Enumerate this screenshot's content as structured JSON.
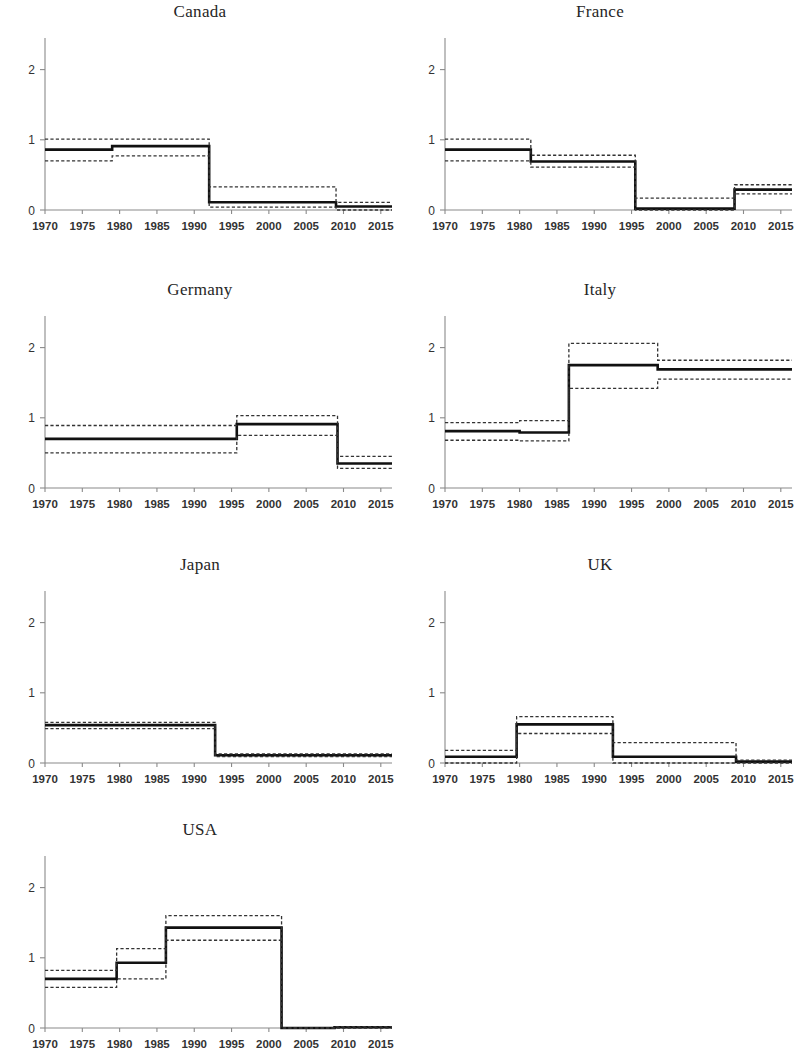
{
  "figure": {
    "panel_count": 7,
    "layout": "4 rows x 2 columns (last row single panel)"
  },
  "axes": {
    "x_ticks": [
      "1970",
      "1975",
      "1980",
      "1985",
      "1990",
      "1995",
      "2000",
      "2005",
      "2010",
      "2015"
    ],
    "x_tick_values": [
      1970,
      1975,
      1980,
      1985,
      1990,
      1995,
      2000,
      2005,
      2010,
      2015
    ],
    "y_ticks": [
      "0",
      "1",
      "2"
    ],
    "y_tick_values": [
      0,
      1,
      2
    ],
    "xlim": [
      1970,
      2016.5
    ],
    "ylim": [
      0,
      2.45
    ]
  },
  "chart_data": [
    {
      "type": "line",
      "title": "Canada",
      "xlabel": "",
      "ylabel": "",
      "xlim": [
        1970,
        2016.5
      ],
      "ylim": [
        0,
        2.45
      ],
      "grid": false,
      "legend": "none",
      "x_ticks": [
        1970,
        1975,
        1980,
        1985,
        1990,
        1995,
        2000,
        2005,
        2010,
        2015
      ],
      "y_ticks": [
        0,
        1,
        2
      ],
      "series": [
        {
          "name": "estimate",
          "style": "solid",
          "steps": [
            {
              "from": 1970,
              "to": 1979,
              "value": 0.86
            },
            {
              "from": 1979,
              "to": 1992,
              "value": 0.91
            },
            {
              "from": 1992,
              "to": 2009,
              "value": 0.11
            },
            {
              "from": 2009,
              "to": 2016.5,
              "value": 0.05
            }
          ]
        },
        {
          "name": "upper-confidence-band",
          "style": "dashed",
          "steps": [
            {
              "from": 1970,
              "to": 1979,
              "value": 1.01
            },
            {
              "from": 1979,
              "to": 1992,
              "value": 1.01
            },
            {
              "from": 1992,
              "to": 2009,
              "value": 0.33
            },
            {
              "from": 2009,
              "to": 2016.5,
              "value": 0.11
            }
          ]
        },
        {
          "name": "lower-confidence-band",
          "style": "dashed",
          "steps": [
            {
              "from": 1970,
              "to": 1979,
              "value": 0.7
            },
            {
              "from": 1979,
              "to": 1992,
              "value": 0.77
            },
            {
              "from": 1992,
              "to": 2009,
              "value": 0.04
            },
            {
              "from": 2009,
              "to": 2016.5,
              "value": 0.0
            }
          ]
        }
      ]
    },
    {
      "type": "line",
      "title": "France",
      "xlabel": "",
      "ylabel": "",
      "xlim": [
        1970,
        2016.5
      ],
      "ylim": [
        0,
        2.45
      ],
      "grid": false,
      "legend": "none",
      "x_ticks": [
        1970,
        1975,
        1980,
        1985,
        1990,
        1995,
        2000,
        2005,
        2010,
        2015
      ],
      "y_ticks": [
        0,
        1,
        2
      ],
      "series": [
        {
          "name": "estimate",
          "style": "solid",
          "steps": [
            {
              "from": 1970,
              "to": 1981.5,
              "value": 0.86
            },
            {
              "from": 1981.5,
              "to": 1995.5,
              "value": 0.69
            },
            {
              "from": 1995.5,
              "to": 2008.8,
              "value": 0.02
            },
            {
              "from": 2008.8,
              "to": 2016.5,
              "value": 0.29
            }
          ]
        },
        {
          "name": "upper-confidence-band",
          "style": "dashed",
          "steps": [
            {
              "from": 1970,
              "to": 1981.5,
              "value": 1.01
            },
            {
              "from": 1981.5,
              "to": 1995.5,
              "value": 0.78
            },
            {
              "from": 1995.5,
              "to": 2008.8,
              "value": 0.17
            },
            {
              "from": 2008.8,
              "to": 2016.5,
              "value": 0.36
            }
          ]
        },
        {
          "name": "lower-confidence-band",
          "style": "dashed",
          "steps": [
            {
              "from": 1970,
              "to": 1981.5,
              "value": 0.7
            },
            {
              "from": 1981.5,
              "to": 1995.5,
              "value": 0.61
            },
            {
              "from": 1995.5,
              "to": 2008.8,
              "value": 0.0
            },
            {
              "from": 2008.8,
              "to": 2016.5,
              "value": 0.23
            }
          ]
        }
      ]
    },
    {
      "type": "line",
      "title": "Germany",
      "xlabel": "",
      "ylabel": "",
      "xlim": [
        1970,
        2016.5
      ],
      "ylim": [
        0,
        2.45
      ],
      "grid": false,
      "legend": "none",
      "x_ticks": [
        1970,
        1975,
        1980,
        1985,
        1990,
        1995,
        2000,
        2005,
        2010,
        2015
      ],
      "y_ticks": [
        0,
        1,
        2
      ],
      "series": [
        {
          "name": "estimate",
          "style": "solid",
          "steps": [
            {
              "from": 1970,
              "to": 1995.7,
              "value": 0.7
            },
            {
              "from": 1995.7,
              "to": 2009.2,
              "value": 0.91
            },
            {
              "from": 2009.2,
              "to": 2016.5,
              "value": 0.35
            }
          ]
        },
        {
          "name": "upper-confidence-band",
          "style": "dashed",
          "steps": [
            {
              "from": 1970,
              "to": 1995.7,
              "value": 0.89
            },
            {
              "from": 1995.7,
              "to": 2009.2,
              "value": 1.03
            },
            {
              "from": 2009.2,
              "to": 2016.5,
              "value": 0.45
            }
          ]
        },
        {
          "name": "lower-confidence-band",
          "style": "dashed",
          "steps": [
            {
              "from": 1970,
              "to": 1995.7,
              "value": 0.5
            },
            {
              "from": 1995.7,
              "to": 2009.2,
              "value": 0.75
            },
            {
              "from": 2009.2,
              "to": 2016.5,
              "value": 0.28
            }
          ]
        }
      ]
    },
    {
      "type": "line",
      "title": "Italy",
      "xlabel": "",
      "ylabel": "",
      "xlim": [
        1970,
        2016.5
      ],
      "ylim": [
        0,
        2.45
      ],
      "grid": false,
      "legend": "none",
      "x_ticks": [
        1970,
        1975,
        1980,
        1985,
        1990,
        1995,
        2000,
        2005,
        2010,
        2015
      ],
      "y_ticks": [
        0,
        1,
        2
      ],
      "series": [
        {
          "name": "estimate",
          "style": "solid",
          "steps": [
            {
              "from": 1970,
              "to": 1980,
              "value": 0.81
            },
            {
              "from": 1980,
              "to": 1986.6,
              "value": 0.79
            },
            {
              "from": 1986.6,
              "to": 1998.5,
              "value": 1.75
            },
            {
              "from": 1998.5,
              "to": 2016.5,
              "value": 1.69
            }
          ]
        },
        {
          "name": "upper-confidence-band",
          "style": "dashed",
          "steps": [
            {
              "from": 1970,
              "to": 1980,
              "value": 0.93
            },
            {
              "from": 1980,
              "to": 1986.6,
              "value": 0.96
            },
            {
              "from": 1986.6,
              "to": 1998.5,
              "value": 2.06
            },
            {
              "from": 1998.5,
              "to": 2016.5,
              "value": 1.82
            }
          ]
        },
        {
          "name": "lower-confidence-band",
          "style": "dashed",
          "steps": [
            {
              "from": 1970,
              "to": 1980,
              "value": 0.68
            },
            {
              "from": 1980,
              "to": 1986.6,
              "value": 0.67
            },
            {
              "from": 1986.6,
              "to": 1998.5,
              "value": 1.42
            },
            {
              "from": 1998.5,
              "to": 2016.5,
              "value": 1.55
            }
          ]
        }
      ]
    },
    {
      "type": "line",
      "title": "Japan",
      "xlabel": "",
      "ylabel": "",
      "xlim": [
        1970,
        2016.5
      ],
      "ylim": [
        0,
        2.45
      ],
      "grid": false,
      "legend": "none",
      "x_ticks": [
        1970,
        1975,
        1980,
        1985,
        1990,
        1995,
        2000,
        2005,
        2010,
        2015
      ],
      "y_ticks": [
        0,
        1,
        2
      ],
      "series": [
        {
          "name": "estimate",
          "style": "solid",
          "steps": [
            {
              "from": 1970,
              "to": 1992.8,
              "value": 0.54
            },
            {
              "from": 1992.8,
              "to": 2016.5,
              "value": 0.11
            }
          ]
        },
        {
          "name": "upper-confidence-band",
          "style": "dashed",
          "steps": [
            {
              "from": 1970,
              "to": 1992.8,
              "value": 0.58
            },
            {
              "from": 1992.8,
              "to": 2016.5,
              "value": 0.13
            }
          ]
        },
        {
          "name": "lower-confidence-band",
          "style": "dashed",
          "steps": [
            {
              "from": 1970,
              "to": 1992.8,
              "value": 0.49
            },
            {
              "from": 1992.8,
              "to": 2016.5,
              "value": 0.09
            }
          ]
        }
      ]
    },
    {
      "type": "line",
      "title": "UK",
      "xlabel": "",
      "ylabel": "",
      "xlim": [
        1970,
        2016.5
      ],
      "ylim": [
        0,
        2.45
      ],
      "grid": false,
      "legend": "none",
      "x_ticks": [
        1970,
        1975,
        1980,
        1985,
        1990,
        1995,
        2000,
        2005,
        2010,
        2015
      ],
      "y_ticks": [
        0,
        1,
        2
      ],
      "series": [
        {
          "name": "estimate",
          "style": "solid",
          "steps": [
            {
              "from": 1970,
              "to": 1979.6,
              "value": 0.09
            },
            {
              "from": 1979.6,
              "to": 1992.5,
              "value": 0.55
            },
            {
              "from": 1992.5,
              "to": 2009.0,
              "value": 0.09
            },
            {
              "from": 2009.0,
              "to": 2016.5,
              "value": 0.02
            }
          ]
        },
        {
          "name": "upper-confidence-band",
          "style": "dashed",
          "steps": [
            {
              "from": 1970,
              "to": 1979.6,
              "value": 0.18
            },
            {
              "from": 1979.6,
              "to": 1992.5,
              "value": 0.66
            },
            {
              "from": 1992.5,
              "to": 2009.0,
              "value": 0.29
            },
            {
              "from": 2009.0,
              "to": 2016.5,
              "value": 0.04
            }
          ]
        },
        {
          "name": "lower-confidence-band",
          "style": "dashed",
          "steps": [
            {
              "from": 1970,
              "to": 1979.6,
              "value": 0.0
            },
            {
              "from": 1979.6,
              "to": 1992.5,
              "value": 0.42
            },
            {
              "from": 1992.5,
              "to": 2009.0,
              "value": 0.0
            },
            {
              "from": 2009.0,
              "to": 2016.5,
              "value": 0.0
            }
          ]
        }
      ]
    },
    {
      "type": "line",
      "title": "USA",
      "xlabel": "",
      "ylabel": "",
      "xlim": [
        1970,
        2016.5
      ],
      "ylim": [
        0,
        2.45
      ],
      "grid": false,
      "legend": "none",
      "x_ticks": [
        1970,
        1975,
        1980,
        1985,
        1990,
        1995,
        2000,
        2005,
        2010,
        2015
      ],
      "y_ticks": [
        0,
        1,
        2
      ],
      "series": [
        {
          "name": "estimate",
          "style": "solid",
          "steps": [
            {
              "from": 1970,
              "to": 1979.6,
              "value": 0.7
            },
            {
              "from": 1979.6,
              "to": 1986.2,
              "value": 0.93
            },
            {
              "from": 1986.2,
              "to": 2001.7,
              "value": 1.43
            },
            {
              "from": 2001.7,
              "to": 2008.8,
              "value": 0.0
            },
            {
              "from": 2008.8,
              "to": 2016.5,
              "value": 0.01
            }
          ]
        },
        {
          "name": "upper-confidence-band",
          "style": "dashed",
          "steps": [
            {
              "from": 1970,
              "to": 1979.6,
              "value": 0.82
            },
            {
              "from": 1979.6,
              "to": 1986.2,
              "value": 1.13
            },
            {
              "from": 1986.2,
              "to": 2001.7,
              "value": 1.6
            },
            {
              "from": 2001.7,
              "to": 2008.8,
              "value": 0.0
            },
            {
              "from": 2008.8,
              "to": 2016.5,
              "value": 0.02
            }
          ]
        },
        {
          "name": "lower-confidence-band",
          "style": "dashed",
          "steps": [
            {
              "from": 1970,
              "to": 1979.6,
              "value": 0.58
            },
            {
              "from": 1979.6,
              "to": 1986.2,
              "value": 0.7
            },
            {
              "from": 1986.2,
              "to": 2001.7,
              "value": 1.25
            },
            {
              "from": 2001.7,
              "to": 2008.8,
              "value": 0.0
            },
            {
              "from": 2008.8,
              "to": 2016.5,
              "value": 0.0
            }
          ]
        }
      ]
    }
  ]
}
